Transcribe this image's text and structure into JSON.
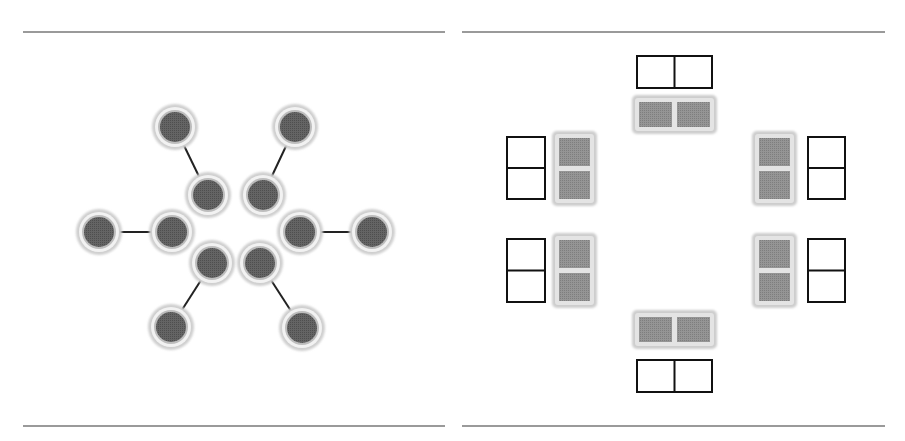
{
  "colors": {
    "rule": "#9a9a9a",
    "node_ring": "#cfcfcf",
    "node_inner_ring": "#f2f2f2",
    "node_core": "#5e5e5e",
    "edge": "#222222",
    "block_frame": "#cdcdcd",
    "block_cell": "#8c8c8c",
    "outline": "#111111"
  },
  "rules": [
    {
      "x1": 23,
      "x2": 445,
      "y": 31
    },
    {
      "x1": 462,
      "x2": 885,
      "y": 31
    },
    {
      "x1": 23,
      "x2": 445,
      "y": 425
    },
    {
      "x1": 462,
      "x2": 885,
      "y": 425
    }
  ],
  "left_panel": {
    "nodes": [
      {
        "id": "outer-top-left",
        "x": 175,
        "y": 127
      },
      {
        "id": "outer-top-right",
        "x": 295,
        "y": 127
      },
      {
        "id": "inner-top-left",
        "x": 208,
        "y": 195
      },
      {
        "id": "inner-top-right",
        "x": 263,
        "y": 195
      },
      {
        "id": "outer-left",
        "x": 99,
        "y": 232
      },
      {
        "id": "inner-left",
        "x": 172,
        "y": 232
      },
      {
        "id": "inner-right",
        "x": 300,
        "y": 232
      },
      {
        "id": "outer-right",
        "x": 372,
        "y": 232
      },
      {
        "id": "inner-bottom-left",
        "x": 212,
        "y": 263
      },
      {
        "id": "inner-bottom-right",
        "x": 260,
        "y": 263
      },
      {
        "id": "outer-bottom-left",
        "x": 171,
        "y": 327
      },
      {
        "id": "outer-bottom-right",
        "x": 302,
        "y": 328
      }
    ],
    "edges": [
      [
        "outer-top-left",
        "inner-top-left"
      ],
      [
        "outer-top-right",
        "inner-top-right"
      ],
      [
        "outer-left",
        "inner-left"
      ],
      [
        "inner-right",
        "outer-right"
      ],
      [
        "inner-bottom-left",
        "outer-bottom-left"
      ],
      [
        "inner-bottom-right",
        "outer-bottom-right"
      ]
    ],
    "node_radius_outer": 23,
    "node_radius_core": 15
  },
  "right_panel": {
    "blocks": [
      {
        "id": "top",
        "orientation": "horizontal",
        "x": 632,
        "y": 95,
        "w": 85,
        "h": 39
      },
      {
        "id": "left-upper",
        "orientation": "vertical",
        "x": 552,
        "y": 131,
        "w": 45,
        "h": 75
      },
      {
        "id": "left-lower",
        "orientation": "vertical",
        "x": 552,
        "y": 233,
        "w": 45,
        "h": 75
      },
      {
        "id": "right-upper",
        "orientation": "vertical",
        "x": 752,
        "y": 131,
        "w": 45,
        "h": 75
      },
      {
        "id": "right-lower",
        "orientation": "vertical",
        "x": 752,
        "y": 233,
        "w": 45,
        "h": 75
      },
      {
        "id": "bottom",
        "orientation": "horizontal",
        "x": 632,
        "y": 310,
        "w": 85,
        "h": 39
      }
    ],
    "outlines": [
      {
        "id": "top",
        "orientation": "horizontal",
        "x": 637,
        "y": 56,
        "w": 75,
        "h": 32
      },
      {
        "id": "left-upper",
        "orientation": "vertical",
        "x": 507,
        "y": 137,
        "w": 38,
        "h": 62
      },
      {
        "id": "left-lower",
        "orientation": "vertical",
        "x": 507,
        "y": 239,
        "w": 38,
        "h": 63
      },
      {
        "id": "right-upper",
        "orientation": "vertical",
        "x": 808,
        "y": 137,
        "w": 37,
        "h": 62
      },
      {
        "id": "right-lower",
        "orientation": "vertical",
        "x": 808,
        "y": 239,
        "w": 37,
        "h": 63
      },
      {
        "id": "bottom",
        "orientation": "horizontal",
        "x": 637,
        "y": 360,
        "w": 75,
        "h": 32
      }
    ]
  }
}
